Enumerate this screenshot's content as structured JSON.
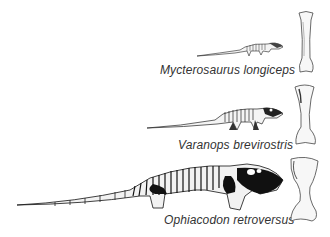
{
  "figure": {
    "background": "#ffffff",
    "ink_color": "#111111",
    "label_color": "#333333",
    "rows": [
      {
        "species": "Mycterosaurus longiceps",
        "skeleton_size": "small",
        "bone": "humerus"
      },
      {
        "species": "Varanops brevirostris",
        "skeleton_size": "medium",
        "bone": "humerus"
      },
      {
        "species": "Ophiacodon retroversus",
        "skeleton_size": "large",
        "bone": "humerus"
      }
    ]
  }
}
